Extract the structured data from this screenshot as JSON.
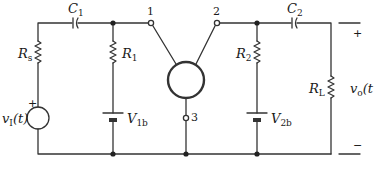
{
  "diagram": {
    "type": "circuit-schematic",
    "colors": {
      "stroke": "#333333",
      "background": "#ffffff"
    },
    "components": {
      "C1": {
        "label": "C",
        "sub": "1"
      },
      "C2": {
        "label": "C",
        "sub": "2"
      },
      "Rs": {
        "label": "R",
        "sub": "s"
      },
      "R1": {
        "label": "R",
        "sub": "1"
      },
      "R2": {
        "label": "R",
        "sub": "2"
      },
      "RL": {
        "label": "R",
        "sub": "L"
      },
      "V1b": {
        "label": "V",
        "sub": "1b"
      },
      "V2b": {
        "label": "V",
        "sub": "2b"
      },
      "vI": {
        "label": "v",
        "sub": "I",
        "suffix": "(t)"
      },
      "vo": {
        "label": "v",
        "sub": "o",
        "suffix": "(t"
      }
    },
    "terminals": {
      "t1": "1",
      "t2": "2",
      "t3": "3"
    },
    "signs": {
      "source_plus": "+",
      "out_plus": "+",
      "out_minus": "−"
    }
  }
}
